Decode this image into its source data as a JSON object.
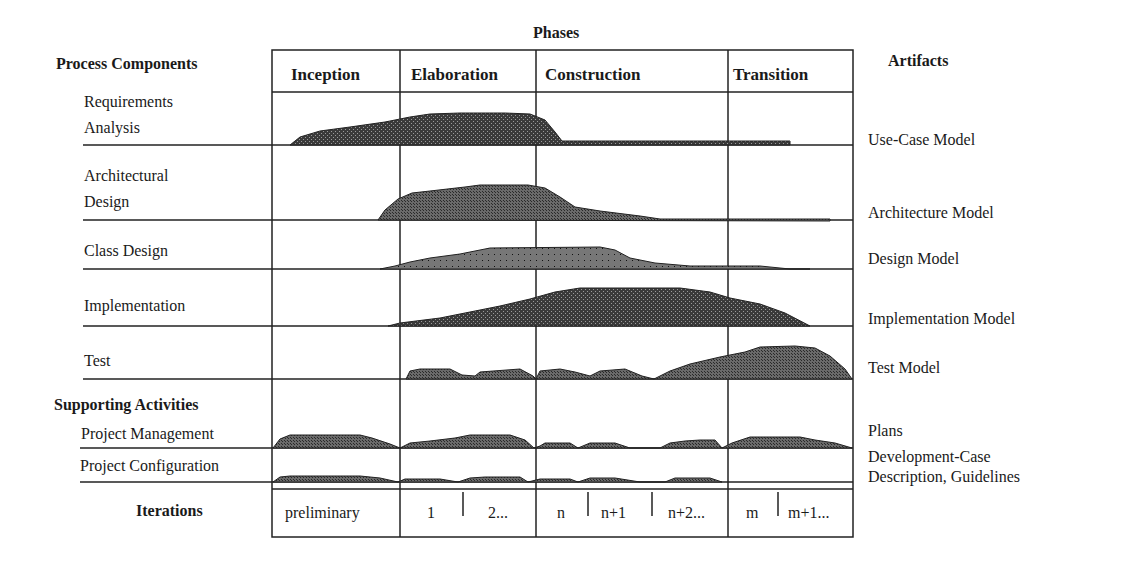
{
  "title": "Phases",
  "left_heading": "Process Components",
  "right_heading": "Artifacts",
  "phases": [
    {
      "label": "Inception"
    },
    {
      "label": "Elaboration"
    },
    {
      "label": "Construction"
    },
    {
      "label": "Transition"
    }
  ],
  "process_components": [
    {
      "line1": "Requirements",
      "line2": "Analysis",
      "artifact": "Use-Case Model"
    },
    {
      "line1": "Architectural",
      "line2": "Design",
      "artifact": "Architecture Model"
    },
    {
      "line1": "Class Design",
      "artifact": "Design Model"
    },
    {
      "line1": "Implementation",
      "artifact": "Implementation Model"
    },
    {
      "line1": "Test",
      "artifact": "Test Model"
    }
  ],
  "supporting_heading": "Supporting Activities",
  "supporting_activities": [
    {
      "label": "Project Management",
      "artifact": "Plans"
    },
    {
      "label": "Project Configuration",
      "artifact_line1": "Development-Case",
      "artifact_line2": "Description, Guidelines"
    }
  ],
  "iterations": {
    "label": "Iterations",
    "cells": [
      "preliminary",
      "1",
      "2...",
      "n",
      "n+1",
      "n+2...",
      "m",
      "m+1..."
    ]
  },
  "colors": {
    "fill": "#555555",
    "line": "#222222"
  }
}
